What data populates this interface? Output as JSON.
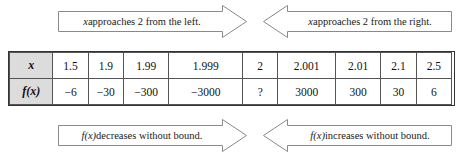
{
  "figure": {
    "accent_color": "#dcdcdc",
    "border_color": "#555555",
    "arrow_stroke": "#8a8a8a"
  },
  "top_banners": {
    "left": {
      "var": "x",
      "text": " approaches 2 from the left.",
      "full": "x approaches 2 from the left."
    },
    "right": {
      "var": "x",
      "text": " approaches 2 from the right.",
      "full": "x approaches 2 from the right."
    }
  },
  "bottom_banners": {
    "left": {
      "var": "f(x)",
      "text": " decreases without bound.",
      "full": "f(x) decreases without bound."
    },
    "right": {
      "var": "f(x)",
      "text": " increases without bound.",
      "full": "f(x) increases without bound."
    }
  },
  "table": {
    "row_labels": [
      "x",
      "f(x)"
    ],
    "x_values": [
      "1.5",
      "1.9",
      "1.99",
      "1.999",
      "2",
      "2.001",
      "2.01",
      "2.1",
      "2.5"
    ],
    "fx_values": [
      "−6",
      "−30",
      "−300",
      "−3000",
      "?",
      "3000",
      "300",
      "30",
      "6"
    ]
  }
}
